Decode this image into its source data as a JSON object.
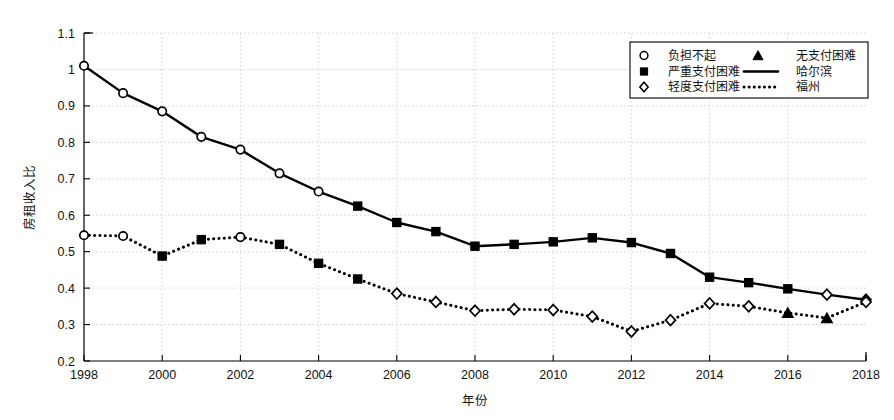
{
  "chart_data": {
    "type": "line",
    "title": "",
    "xlabel": "年份",
    "ylabel": "房租收入比",
    "xlim": [
      1998,
      2018
    ],
    "ylim": [
      0.2,
      1.1
    ],
    "yticks": [
      "0.2",
      "0.3",
      "0.4",
      "0.5",
      "0.6",
      "0.7",
      "0.8",
      "0.9",
      "1",
      "1.1"
    ],
    "ytick_values": [
      0.2,
      0.3,
      0.4,
      0.5,
      0.6,
      0.7,
      0.8,
      0.9,
      1.0,
      1.1
    ],
    "xticks": [
      "1998",
      "2000",
      "2002",
      "2004",
      "2006",
      "2008",
      "2010",
      "2012",
      "2014",
      "2016",
      "2018"
    ],
    "xtick_values": [
      1998,
      2000,
      2002,
      2004,
      2006,
      2008,
      2010,
      2012,
      2014,
      2016,
      2018
    ],
    "x": [
      1998,
      1999,
      2000,
      2001,
      2002,
      2003,
      2004,
      2005,
      2006,
      2007,
      2008,
      2009,
      2010,
      2011,
      2012,
      2013,
      2014,
      2015,
      2016,
      2017,
      2018
    ],
    "grid": true,
    "legend_position": "top-right",
    "series": [
      {
        "name": "哈尔滨",
        "line_style": "solid",
        "values": [
          1.01,
          0.935,
          0.885,
          0.815,
          0.78,
          0.715,
          0.665,
          0.625,
          0.58,
          0.555,
          0.515,
          0.52,
          0.527,
          0.538,
          0.525,
          0.495,
          0.43,
          0.415,
          0.398,
          0.382,
          0.368
        ],
        "markers": [
          "circle",
          "circle",
          "circle",
          "circle",
          "circle",
          "circle",
          "circle",
          "square",
          "square",
          "square",
          "square",
          "square",
          "square",
          "square",
          "square",
          "square",
          "square",
          "square",
          "square",
          "diamond",
          "diamond"
        ]
      },
      {
        "name": "福州",
        "line_style": "dotted",
        "values": [
          0.545,
          0.543,
          0.488,
          0.533,
          0.54,
          0.52,
          0.468,
          0.425,
          0.385,
          0.362,
          0.338,
          0.342,
          0.34,
          0.322,
          0.281,
          0.312,
          0.358,
          0.35,
          0.332,
          0.318,
          0.362
        ],
        "markers": [
          "circle",
          "circle",
          "square",
          "square",
          "circle",
          "square",
          "square",
          "square",
          "diamond",
          "diamond",
          "diamond",
          "diamond",
          "diamond",
          "diamond",
          "diamond",
          "diamond",
          "diamond",
          "diamond",
          "triangle",
          "triangle",
          "diamond"
        ]
      }
    ],
    "legend": [
      {
        "label": "负担不起",
        "marker": "circle",
        "kind": "marker"
      },
      {
        "label": "无支付困难",
        "marker": "triangle",
        "kind": "marker"
      },
      {
        "label": "严重支付困难",
        "marker": "square",
        "kind": "marker"
      },
      {
        "label": "哈尔滨",
        "marker": "line-solid",
        "kind": "line"
      },
      {
        "label": "轻度支付困难",
        "marker": "diamond",
        "kind": "marker"
      },
      {
        "label": "福州",
        "marker": "line-dotted",
        "kind": "line"
      }
    ],
    "colors": {
      "line": "#000000",
      "marker_fill_open": "#ffffff",
      "marker_fill_solid": "#000000",
      "grid": "#c8c8c8",
      "axis": "#000000",
      "background": "#ffffff"
    }
  }
}
